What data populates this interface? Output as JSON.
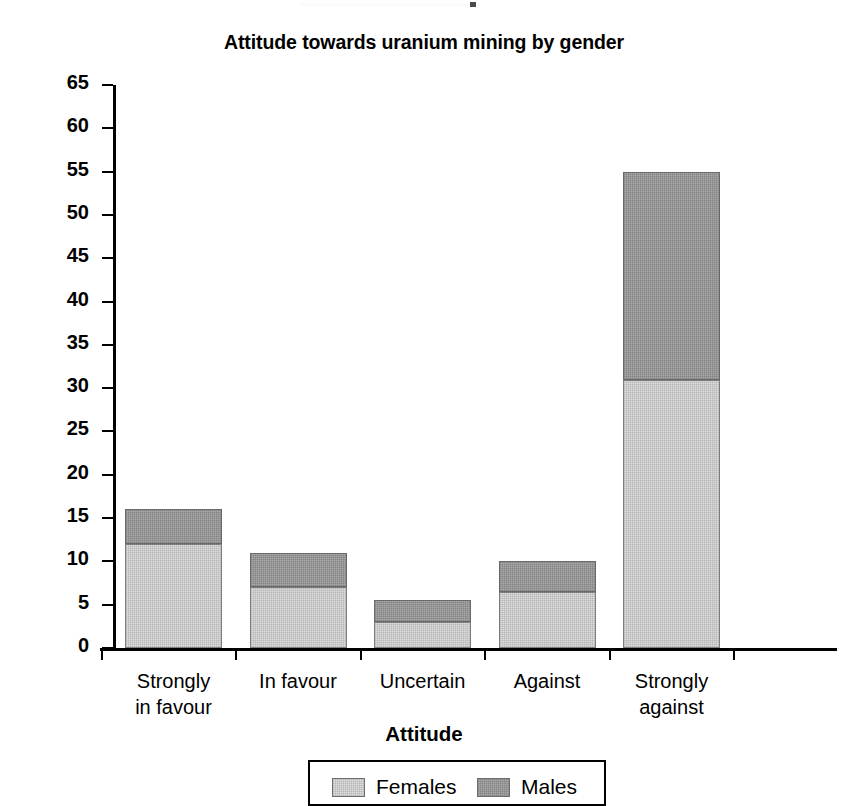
{
  "chart_data": {
    "type": "bar",
    "subtype": "stacked-bar",
    "title": "Attitude towards uranium mining by gender",
    "xlabel": "Attitude",
    "ylabel": "Number of respondents",
    "categories": [
      "Strongly\nin favour",
      "In favour",
      "Uncertain",
      "Against",
      "Strongly\nagainst"
    ],
    "series": [
      {
        "name": "Females",
        "values": [
          12,
          7,
          3,
          6.5,
          31
        ],
        "color": "#dedede"
      },
      {
        "name": "Males",
        "values": [
          4,
          4,
          2.5,
          3.5,
          24
        ],
        "color": "#a9a9a9"
      }
    ],
    "totals": [
      16,
      11,
      5.5,
      10,
      55
    ],
    "ylim": [
      0,
      65
    ],
    "ytick_step": 5,
    "yticks": [
      "0",
      "5",
      "10",
      "15",
      "20",
      "25",
      "30",
      "35",
      "40",
      "45",
      "50",
      "55",
      "60",
      "65"
    ],
    "grid": false,
    "legend_position": "bottom"
  },
  "legend": {
    "entries": [
      {
        "label": "Females",
        "swatch": "light-gray-swatch"
      },
      {
        "label": "Males",
        "swatch": "dark-gray-swatch"
      }
    ]
  }
}
